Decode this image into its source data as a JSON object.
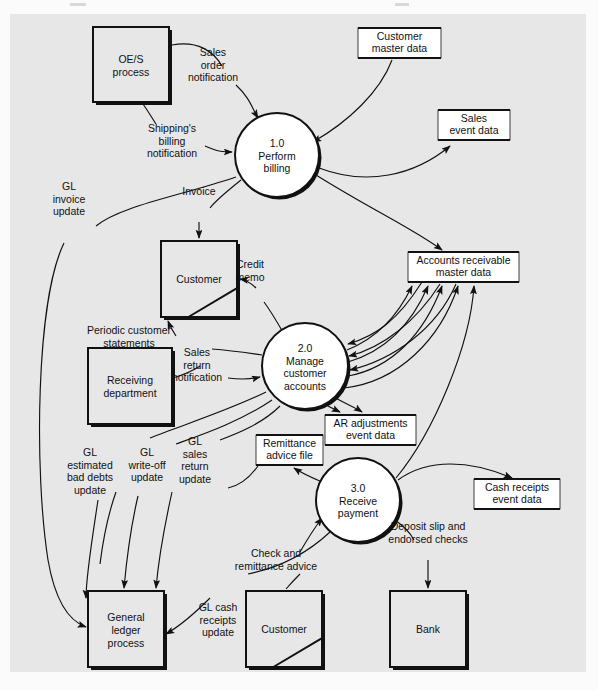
{
  "diagram": {
    "background_color": "#e7e7e7",
    "page_color": "#fbfbfb",
    "line_color": "#111111",
    "store_fill": "#ffffff",
    "entity_fill": "#e7e7e7"
  },
  "processes": [
    {
      "id": "p1",
      "number": "1.0",
      "line1": "Perform",
      "line2": "billing",
      "line3": "",
      "cx": 277,
      "cy": 155,
      "r": 42
    },
    {
      "id": "p2",
      "number": "2.0",
      "line1": "Manage",
      "line2": "customer",
      "line3": "accounts",
      "cx": 305,
      "cy": 366,
      "r": 43
    },
    {
      "id": "p3",
      "number": "3.0",
      "line1": "Receive",
      "line2": "payment",
      "line3": "",
      "cx": 358,
      "cy": 500,
      "r": 42
    }
  ],
  "entities": [
    {
      "id": "e_oes",
      "line1": "OE/S",
      "line2": "process",
      "x": 93,
      "y": 27,
      "w": 76,
      "h": 75,
      "corner": false
    },
    {
      "id": "e_cust_top",
      "line1": "Customer",
      "line2": "",
      "x": 161,
      "y": 241,
      "w": 76,
      "h": 76,
      "corner": true
    },
    {
      "id": "e_recv",
      "line1": "Receiving",
      "line2": "department",
      "x": 88,
      "y": 348,
      "w": 84,
      "h": 76,
      "corner": false
    },
    {
      "id": "e_gl",
      "line1": "General",
      "line2": "ledger",
      "line3": "process",
      "x": 88,
      "y": 591,
      "w": 76,
      "h": 76,
      "corner": false
    },
    {
      "id": "e_cust_bot",
      "line1": "Customer",
      "line2": "",
      "x": 246,
      "y": 591,
      "w": 76,
      "h": 76,
      "corner": true
    },
    {
      "id": "e_bank",
      "line1": "Bank",
      "line2": "",
      "x": 390,
      "y": 591,
      "w": 76,
      "h": 76,
      "corner": false
    }
  ],
  "datastores": [
    {
      "id": "d_custmaster",
      "line1": "Customer",
      "line2": "master data",
      "x": 358,
      "y": 28,
      "w": 83,
      "h": 30
    },
    {
      "id": "d_salesevent",
      "line1": "Sales",
      "line2": "event data",
      "x": 438,
      "y": 110,
      "w": 72,
      "h": 30
    },
    {
      "id": "d_ar",
      "line1": "Accounts receivable",
      "line2": "master data",
      "x": 408,
      "y": 252,
      "w": 111,
      "h": 30
    },
    {
      "id": "d_aradj",
      "line1": "AR adjustments",
      "line2": "event data",
      "x": 325,
      "y": 415,
      "w": 91,
      "h": 30
    },
    {
      "id": "d_remit",
      "line1": "Remittance",
      "line2": "advice file",
      "x": 256,
      "y": 435,
      "w": 67,
      "h": 30
    },
    {
      "id": "d_cashreceipts",
      "line1": "Cash receipts",
      "line2": "event data",
      "x": 474,
      "y": 479,
      "w": 86,
      "h": 30
    }
  ],
  "flows": [
    {
      "id": "f_salesorder",
      "label": [
        "Sales",
        "order",
        "notification"
      ],
      "from": "e_oes",
      "to": "p1"
    },
    {
      "id": "f_shipbill",
      "label": [
        "Shipping's",
        "billing",
        "notification"
      ],
      "from": "e_oes",
      "to": "p1"
    },
    {
      "id": "f_custmaster",
      "label": [],
      "from": "d_custmaster",
      "to": "p1"
    },
    {
      "id": "f_salesevent",
      "label": [],
      "from": "p1",
      "to": "d_salesevent"
    },
    {
      "id": "f_glinvoice",
      "label": [
        "GL",
        "invoice",
        "update"
      ],
      "from": "p1",
      "to": "e_gl"
    },
    {
      "id": "f_invoice",
      "label": [
        "Invoice"
      ],
      "from": "p1",
      "to": "e_cust_top"
    },
    {
      "id": "f_ar_from_p1",
      "label": [],
      "from": "p1",
      "to": "d_ar"
    },
    {
      "id": "f_creditmemo",
      "label": [
        "Credit",
        "memo"
      ],
      "from": "p2",
      "to": "e_cust_top"
    },
    {
      "id": "f_periodic",
      "label": [
        "Periodic customer",
        "statements"
      ],
      "from": "p2",
      "to": "e_cust_top"
    },
    {
      "id": "f_salesreturn",
      "label": [
        "Sales",
        "return",
        "notification"
      ],
      "from": "e_recv",
      "to": "p2"
    },
    {
      "id": "f_aradj",
      "label": [],
      "from": "p2",
      "to": "d_aradj"
    },
    {
      "id": "f_glbaddebts",
      "label": [
        "GL",
        "estimated",
        "bad debts",
        "update"
      ],
      "from": "p2",
      "to": "e_gl"
    },
    {
      "id": "f_glwriteoff",
      "label": [
        "GL",
        "write-off",
        "update"
      ],
      "from": "p2",
      "to": "e_gl"
    },
    {
      "id": "f_glsalesreturn",
      "label": [
        "GL",
        "sales",
        "return",
        "update"
      ],
      "from": "p2",
      "to": "e_gl"
    },
    {
      "id": "f_remit",
      "label": [],
      "from": "p3",
      "to": "d_remit"
    },
    {
      "id": "f_checkremit",
      "label": [
        "Check and",
        "remittance advice"
      ],
      "from": "e_cust_bot",
      "to": "p3"
    },
    {
      "id": "f_deposit",
      "label": [
        "Deposit slip and",
        "endorsed checks"
      ],
      "from": "p3",
      "to": "e_bank"
    },
    {
      "id": "f_cashreceipts",
      "label": [],
      "from": "p3",
      "to": "d_cashreceipts"
    },
    {
      "id": "f_glcash",
      "label": [
        "GL cash",
        "receipts",
        "update"
      ],
      "from": "p3",
      "to": "e_gl"
    }
  ]
}
